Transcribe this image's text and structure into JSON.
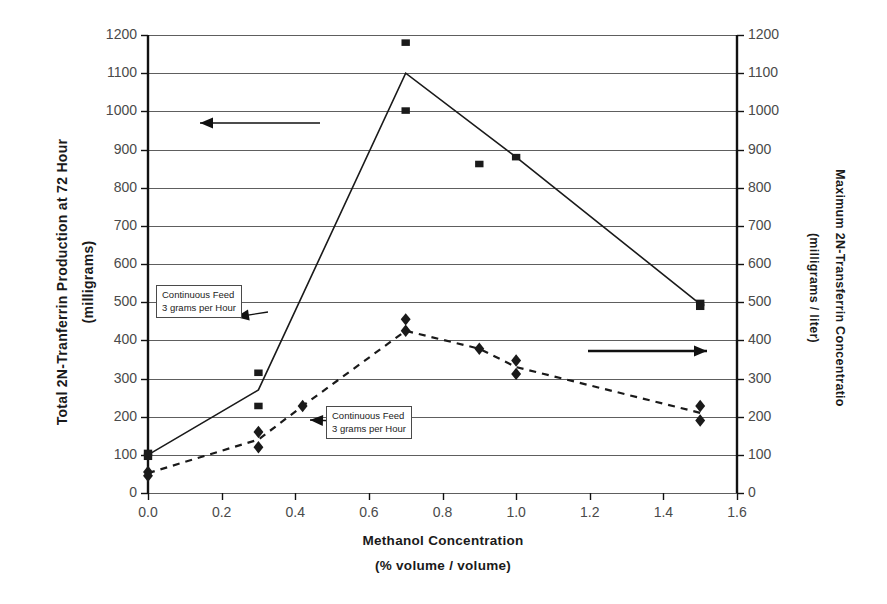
{
  "chart_data": {
    "type": "line",
    "title": "",
    "xlabel": "Methanol Concentration",
    "xlabel_sub": "(% volume / volume)",
    "ylabel_left": "Total 2N-Tranferrin Production at 72 Hour",
    "ylabel_left_sub": "(milligrams)",
    "ylabel_right": "Maximum 2N-Transferrin Concentratio",
    "ylabel_right_sub": "(milligrams / liter)",
    "xlim": [
      0.0,
      1.6
    ],
    "ylim_left": [
      0,
      1200
    ],
    "ylim_right": [
      0,
      1200
    ],
    "grid": true,
    "legend_position": "none",
    "xticks": [
      "0.0",
      "0.2",
      "0.4",
      "0.6",
      "0.8",
      "1.0",
      "1.2",
      "1.4",
      "1.6"
    ],
    "xtick_values": [
      0.0,
      0.2,
      0.4,
      0.6,
      0.8,
      1.0,
      1.2,
      1.4,
      1.6
    ],
    "yticks_left": [
      "0",
      "100",
      "200",
      "300",
      "400",
      "500",
      "600",
      "700",
      "800",
      "900",
      "1000",
      "1100",
      "1200"
    ],
    "yticks_right": [
      "0",
      "100",
      "200",
      "300",
      "400",
      "500",
      "600",
      "700",
      "800",
      "900",
      "1000",
      "1100",
      "1200"
    ],
    "ytick_values": [
      0,
      100,
      200,
      300,
      400,
      500,
      600,
      700,
      800,
      900,
      1000,
      1100,
      1200
    ],
    "series": [
      {
        "name": "Total 2N-Tranferrin Production at 72 Hour",
        "axis": "left",
        "marker": "square",
        "linestyle": "solid",
        "color": "#1a1a1a",
        "x": [
          0.0,
          0.3,
          0.7,
          1.0,
          1.5
        ],
        "values": [
          100,
          270,
          1100,
          880,
          495
        ],
        "scatter_x": [
          0.0,
          0.0,
          0.3,
          0.3,
          0.7,
          0.7,
          0.9,
          1.0,
          1.5,
          1.5
        ],
        "scatter_values": [
          105,
          95,
          315,
          228,
          1180,
          1002,
          862,
          880,
          498,
          488
        ]
      },
      {
        "name": "Maximum 2N-Transferrin Concentration",
        "axis": "right",
        "marker": "diamond",
        "linestyle": "dashed",
        "color": "#1a1a1a",
        "x": [
          0.0,
          0.3,
          0.42,
          0.7,
          0.9,
          1.0,
          1.5
        ],
        "values": [
          52,
          140,
          228,
          425,
          378,
          330,
          210
        ],
        "scatter_x": [
          0.0,
          0.0,
          0.3,
          0.3,
          0.42,
          0.7,
          0.7,
          0.9,
          1.0,
          1.0,
          1.5,
          1.5
        ],
        "scatter_values": [
          55,
          45,
          160,
          120,
          228,
          455,
          425,
          378,
          347,
          312,
          228,
          190
        ]
      }
    ],
    "annotations": [
      {
        "id": "callout-left-series",
        "text_line1": "Continuous Feed",
        "text_line2": "3 grams per Hour",
        "points_to": "square-series"
      },
      {
        "id": "callout-right-series",
        "text_line1": "Continuous Feed",
        "text_line2": "3 grams per Hour",
        "points_to": "diamond-series"
      },
      {
        "id": "arrow-to-left-axis",
        "direction": "left",
        "meaning": "square series uses left axis"
      },
      {
        "id": "arrow-to-right-axis",
        "direction": "right",
        "meaning": "diamond series uses right axis"
      }
    ]
  }
}
